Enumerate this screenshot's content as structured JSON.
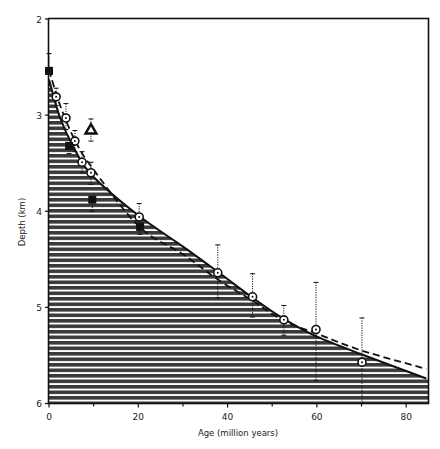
{
  "chart_data": {
    "type": "scatter",
    "title": "",
    "xlabel": "Age (million years)",
    "ylabel": "Depth (km)",
    "xlim": [
      0,
      85
    ],
    "ylim": [
      6,
      2
    ],
    "y_inverted": true,
    "grid": false,
    "x_ticks": [
      0,
      20,
      40,
      60,
      80
    ],
    "x_minor_ticks": [
      10,
      30,
      50,
      70
    ],
    "y_ticks": [
      2,
      3,
      4,
      5,
      6
    ],
    "series": [
      {
        "name": "Circles (with error bars)",
        "marker": "circle-dot",
        "points": [
          {
            "x": 1.6,
            "y": 2.81,
            "err_low": 2.72,
            "err_high": 2.9
          },
          {
            "x": 3.8,
            "y": 3.03,
            "err_low": 2.88,
            "err_high": 3.15
          },
          {
            "x": 5.8,
            "y": 3.27,
            "err_low": 3.16,
            "err_high": 3.38
          },
          {
            "x": 7.4,
            "y": 3.49,
            "err_low": 3.38,
            "err_high": 3.6
          },
          {
            "x": 9.4,
            "y": 3.6,
            "err_low": 3.49,
            "err_high": 3.72
          },
          {
            "x": 20.2,
            "y": 4.06,
            "err_low": 3.92,
            "err_high": 4.2
          },
          {
            "x": 37.8,
            "y": 4.64,
            "err_low": 4.35,
            "err_high": 4.9
          },
          {
            "x": 45.6,
            "y": 4.89,
            "err_low": 4.65,
            "err_high": 5.1
          },
          {
            "x": 52.6,
            "y": 5.13,
            "err_low": 4.98,
            "err_high": 5.29
          },
          {
            "x": 59.8,
            "y": 5.23,
            "err_low": 4.74,
            "err_high": 5.76
          },
          {
            "x": 70.1,
            "y": 5.57,
            "err_low": 5.11,
            "err_high": 6.0
          }
        ]
      },
      {
        "name": "Filled squares",
        "marker": "square",
        "points": [
          {
            "x": 0,
            "y": 2.54,
            "err_low": 2.36,
            "err_high": 2.54
          },
          {
            "x": 4.5,
            "y": 3.32,
            "err_low": 3.32,
            "err_high": 3.4
          },
          {
            "x": 9.7,
            "y": 3.88,
            "err_low": 3.88,
            "err_high": 4.0
          },
          {
            "x": 20.4,
            "y": 4.16,
            "err_low": 4.16,
            "err_high": 4.24
          }
        ]
      },
      {
        "name": "Open triangle",
        "marker": "triangle",
        "points": [
          {
            "x": 9.4,
            "y": 3.15,
            "err_low": 3.04,
            "err_high": 3.27
          }
        ]
      }
    ],
    "curves": [
      {
        "name": "Solid model curve (hatched below)",
        "style": "solid",
        "points": [
          [
            0,
            2.63
          ],
          [
            2.5,
            3.03
          ],
          [
            5.8,
            3.36
          ],
          [
            9.7,
            3.63
          ],
          [
            20.2,
            4.05
          ],
          [
            30.1,
            4.37
          ],
          [
            37.8,
            4.63
          ],
          [
            45.6,
            4.9
          ],
          [
            52.6,
            5.12
          ],
          [
            59.8,
            5.3
          ],
          [
            70.1,
            5.49
          ],
          [
            84.5,
            5.74
          ]
        ]
      },
      {
        "name": "Dashed model curve",
        "style": "dashed",
        "points": [
          [
            0,
            2.53
          ],
          [
            2.5,
            2.9
          ],
          [
            5.8,
            3.26
          ],
          [
            9.7,
            3.55
          ],
          [
            20.2,
            4.16
          ],
          [
            30.1,
            4.45
          ],
          [
            37.8,
            4.71
          ],
          [
            45.6,
            4.93
          ],
          [
            52.6,
            5.14
          ],
          [
            59.8,
            5.27
          ],
          [
            70.1,
            5.45
          ],
          [
            84.5,
            5.64
          ]
        ]
      }
    ],
    "fill": {
      "description": "Horizontal-line hatching between solid curve and depth 6",
      "color": "#3a3a3a"
    },
    "legend": null
  },
  "colors": {
    "ink": "#111111",
    "hatch": "#3a3a3a",
    "background": "#ffffff"
  }
}
